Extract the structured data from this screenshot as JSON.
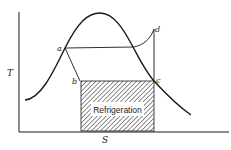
{
  "diagram": {
    "type": "T-S diagram (vapor-compression refrigeration cycle)",
    "axes": {
      "y_label": "T",
      "x_label": "S"
    },
    "points": {
      "a": "a",
      "b": "b",
      "c": "c",
      "d": "d"
    },
    "region_label": "Refrigeration",
    "colors": {
      "line": "#1a1a1a",
      "background": "#ffffff",
      "hatch": "#333333"
    }
  }
}
